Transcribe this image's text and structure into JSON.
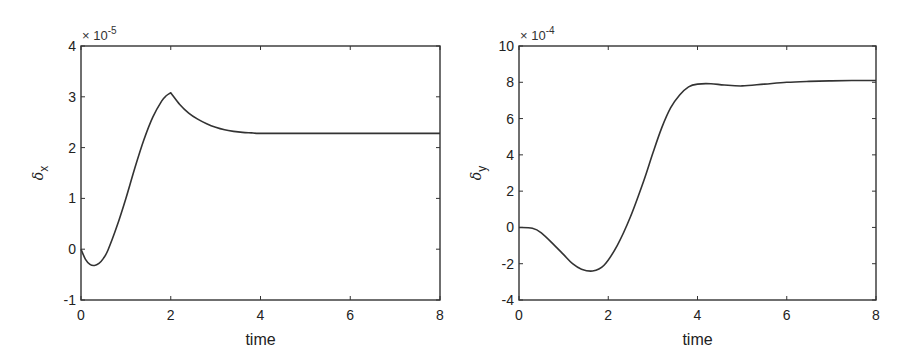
{
  "chart_data": [
    {
      "type": "line",
      "title": "",
      "xlabel": "time",
      "ylabel": "δx",
      "ylabel_main": "δ",
      "ylabel_sub": "x",
      "y_scale_annotation": "× 10",
      "y_scale_exponent": "-5",
      "xlim": [
        0,
        8
      ],
      "ylim": [
        -1,
        4
      ],
      "xticks": [
        "0",
        "2",
        "4",
        "6",
        "8"
      ],
      "yticks": [
        "-1",
        "0",
        "1",
        "2",
        "3",
        "4"
      ],
      "grid": false,
      "legend": null,
      "series": [
        {
          "name": "delta_x",
          "color": "#333333",
          "x": [
            0,
            0.1,
            0.2,
            0.3,
            0.4,
            0.5,
            0.6,
            0.8,
            1.0,
            1.2,
            1.4,
            1.6,
            1.8,
            1.9,
            2.0,
            2.2,
            2.4,
            2.6,
            2.8,
            3.0,
            3.2,
            3.4,
            3.6,
            3.8,
            4.0,
            5.0,
            6.0,
            7.0,
            8.0
          ],
          "values": [
            0.0,
            -0.2,
            -0.3,
            -0.32,
            -0.28,
            -0.18,
            -0.02,
            0.45,
            1.0,
            1.6,
            2.15,
            2.6,
            2.92,
            3.02,
            3.08,
            2.85,
            2.68,
            2.56,
            2.47,
            2.4,
            2.35,
            2.32,
            2.3,
            2.29,
            2.28,
            2.28,
            2.28,
            2.28,
            2.28
          ]
        }
      ]
    },
    {
      "type": "line",
      "title": "",
      "xlabel": "time",
      "ylabel": "δy",
      "ylabel_main": "δ",
      "ylabel_sub": "y",
      "y_scale_annotation": "× 10",
      "y_scale_exponent": "-4",
      "xlim": [
        0,
        8
      ],
      "ylim": [
        -4,
        10
      ],
      "xticks": [
        "0",
        "2",
        "4",
        "6",
        "8"
      ],
      "yticks": [
        "-4",
        "-2",
        "0",
        "2",
        "4",
        "6",
        "8",
        "10"
      ],
      "grid": false,
      "legend": null,
      "series": [
        {
          "name": "delta_y",
          "color": "#333333",
          "x": [
            0,
            0.3,
            0.5,
            0.8,
            1.0,
            1.2,
            1.4,
            1.65,
            1.9,
            2.2,
            2.5,
            2.8,
            3.0,
            3.2,
            3.4,
            3.6,
            3.8,
            4.0,
            4.3,
            4.6,
            5.0,
            5.5,
            6.0,
            6.5,
            7.0,
            7.5,
            8.0
          ],
          "values": [
            0.0,
            -0.05,
            -0.3,
            -1.0,
            -1.5,
            -2.0,
            -2.3,
            -2.4,
            -2.1,
            -1.0,
            0.6,
            2.6,
            4.1,
            5.5,
            6.6,
            7.3,
            7.75,
            7.9,
            7.92,
            7.85,
            7.8,
            7.9,
            8.0,
            8.05,
            8.08,
            8.1,
            8.1
          ]
        }
      ]
    }
  ]
}
